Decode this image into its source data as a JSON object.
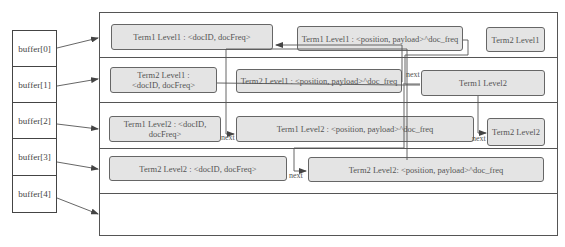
{
  "buffers": [
    {
      "label": "buffer[0]"
    },
    {
      "label": "buffer[1]"
    },
    {
      "label": "buffer[2]"
    },
    {
      "label": "buffer[3]"
    },
    {
      "label": "buffer[4]"
    }
  ],
  "rows": [
    {
      "nodes": [
        {
          "label": "Term1 Level1 : <docID, docFreq>"
        },
        {
          "label": "Term1 Level1 : <position, payload>^doc_freq"
        },
        {
          "label": "Term2 Level1"
        }
      ]
    },
    {
      "nodes": [
        {
          "label": "Term2 Level1 :\n<docID, docFreq>"
        },
        {
          "label": "Term2 Level1 : <position, payload>^doc_freq"
        },
        {
          "label": "Term1 Level2"
        }
      ]
    },
    {
      "nodes": [
        {
          "label": "Term1 Level2 : <docID, docFreq>"
        },
        {
          "label": "Term1 Level2 : <position, payload>^doc_freq"
        },
        {
          "label": "Term2 Level2"
        }
      ]
    },
    {
      "nodes": [
        {
          "label": "Term2 Level2 : <docID, docFreq>"
        },
        {
          "label": "Term2 Level2: <position, payload>^doc_freq"
        }
      ]
    },
    {
      "nodes": []
    }
  ],
  "pointer_labels": {
    "next_1": "next",
    "next_2": "next",
    "next_3": "next",
    "next_4": "next"
  },
  "colors": {
    "node_fill": "#e4e4e4",
    "node_border": "#666666",
    "line": "#555555"
  }
}
